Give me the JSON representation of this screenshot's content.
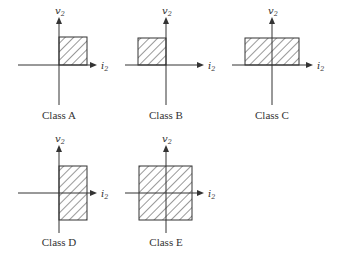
{
  "diagram": {
    "colors": {
      "stroke": "#333333",
      "background": "#ffffff"
    },
    "axis_labels": {
      "vertical": "v",
      "vertical_sub": "2",
      "horizontal": "i",
      "horizontal_sub": "2"
    },
    "panels": [
      {
        "id": "A",
        "label": "Class A",
        "quadrants": [
          "I"
        ]
      },
      {
        "id": "B",
        "label": "Class B",
        "quadrants": [
          "II"
        ]
      },
      {
        "id": "C",
        "label": "Class C",
        "quadrants": [
          "I",
          "II"
        ]
      },
      {
        "id": "D",
        "label": "Class D",
        "quadrants": [
          "I",
          "IV"
        ]
      },
      {
        "id": "E",
        "label": "Class E",
        "quadrants": [
          "I",
          "II",
          "III",
          "IV"
        ]
      }
    ]
  }
}
